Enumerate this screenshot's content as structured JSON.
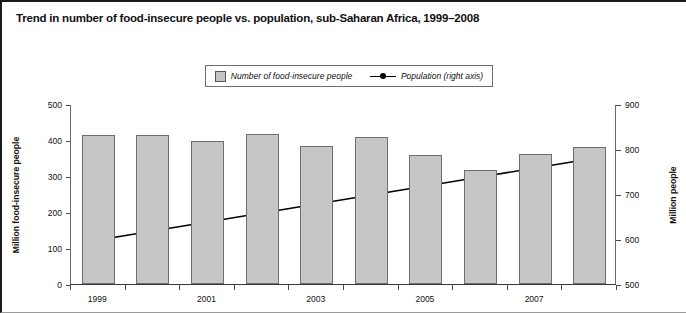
{
  "title": "Trend in number of food-insecure people vs. population, sub-Saharan Africa, 1999–2008",
  "legend": {
    "bar_label": "Number of food-insecure people",
    "line_label": "Population (right axis)",
    "bar_swatch_icon": "square-swatch-icon",
    "line_swatch_icon": "line-marker-icon"
  },
  "axes": {
    "left_title": "Million food-insecure people",
    "right_title": "Million people",
    "left_ticks": [
      "500",
      "400",
      "300",
      "200",
      "100",
      "0"
    ],
    "right_ticks": [
      "900",
      "800",
      "700",
      "600",
      "500"
    ],
    "x_ticks": [
      "1999",
      "2001",
      "2003",
      "2005",
      "2007"
    ]
  },
  "colors": {
    "bar_fill": "#c6c6c6",
    "bar_stroke": "#6e6e6e",
    "line": "#000000",
    "marker": "#000000",
    "axis": "#4a4a4a",
    "text": "#111111"
  },
  "chart_data": {
    "type": "bar",
    "title": "Trend in number of food-insecure people vs. population, sub-Saharan Africa, 1999–2008",
    "xlabel": "",
    "ylabel": "Million food-insecure people",
    "y2label": "Million people",
    "categories": [
      "1999",
      "2000",
      "2001",
      "2002",
      "2003",
      "2004",
      "2005",
      "2006",
      "2007",
      "2008"
    ],
    "ylim": [
      0,
      500
    ],
    "y2lim": [
      500,
      900
    ],
    "ytick_step": 100,
    "y2tick_step": 100,
    "grid": false,
    "legend_position": "top-center",
    "series": [
      {
        "name": "Number of food-insecure people",
        "type": "bar",
        "axis": "left",
        "unit": "million people",
        "values": [
          415,
          415,
          398,
          418,
          383,
          408,
          357,
          318,
          360,
          380
        ]
      },
      {
        "name": "Population (right axis)",
        "type": "line",
        "axis": "right",
        "unit": "million people",
        "marker": "circle",
        "values": [
          600,
          620,
          640,
          660,
          680,
          700,
          720,
          740,
          760,
          780
        ]
      }
    ],
    "x_tick_labels_shown": [
      "1999",
      "2001",
      "2003",
      "2005",
      "2007"
    ]
  }
}
